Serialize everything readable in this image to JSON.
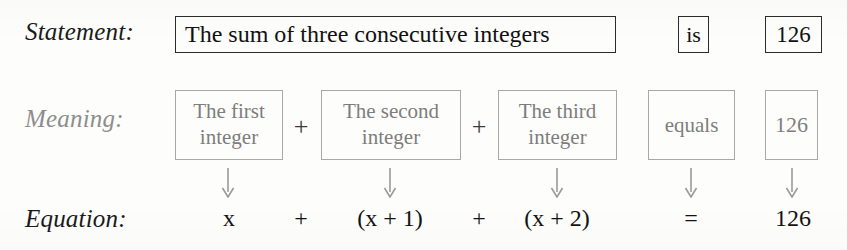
{
  "rows": {
    "statement": {
      "label": "Statement:",
      "phrase": "The sum of three consecutive integers",
      "verb": "is",
      "value": "126"
    },
    "meaning": {
      "label": "Meaning:",
      "terms": [
        {
          "line1": "The first",
          "line2": "integer"
        },
        {
          "line1": "The second",
          "line2": "integer"
        },
        {
          "line1": "The third",
          "line2": "integer"
        }
      ],
      "operators": [
        "+",
        "+"
      ],
      "verb": "equals",
      "value": "126"
    },
    "equation": {
      "label": "Equation:",
      "terms": [
        "x",
        "(x + 1)",
        "(x + 2)"
      ],
      "operators": [
        "+",
        "+"
      ],
      "relation": "=",
      "value": "126"
    }
  },
  "arrows": {
    "glyph": "down-arrow",
    "count": 5,
    "color": "#9a9a9a"
  },
  "colors": {
    "background": "#fdfdfb",
    "statement_text": "#111111",
    "statement_border": "#2b2b2b",
    "meaning_text": "#7d7d7d",
    "meaning_border": "#a8a8a8",
    "equation_text": "#121212",
    "label_muted": "#8d8d8d"
  }
}
